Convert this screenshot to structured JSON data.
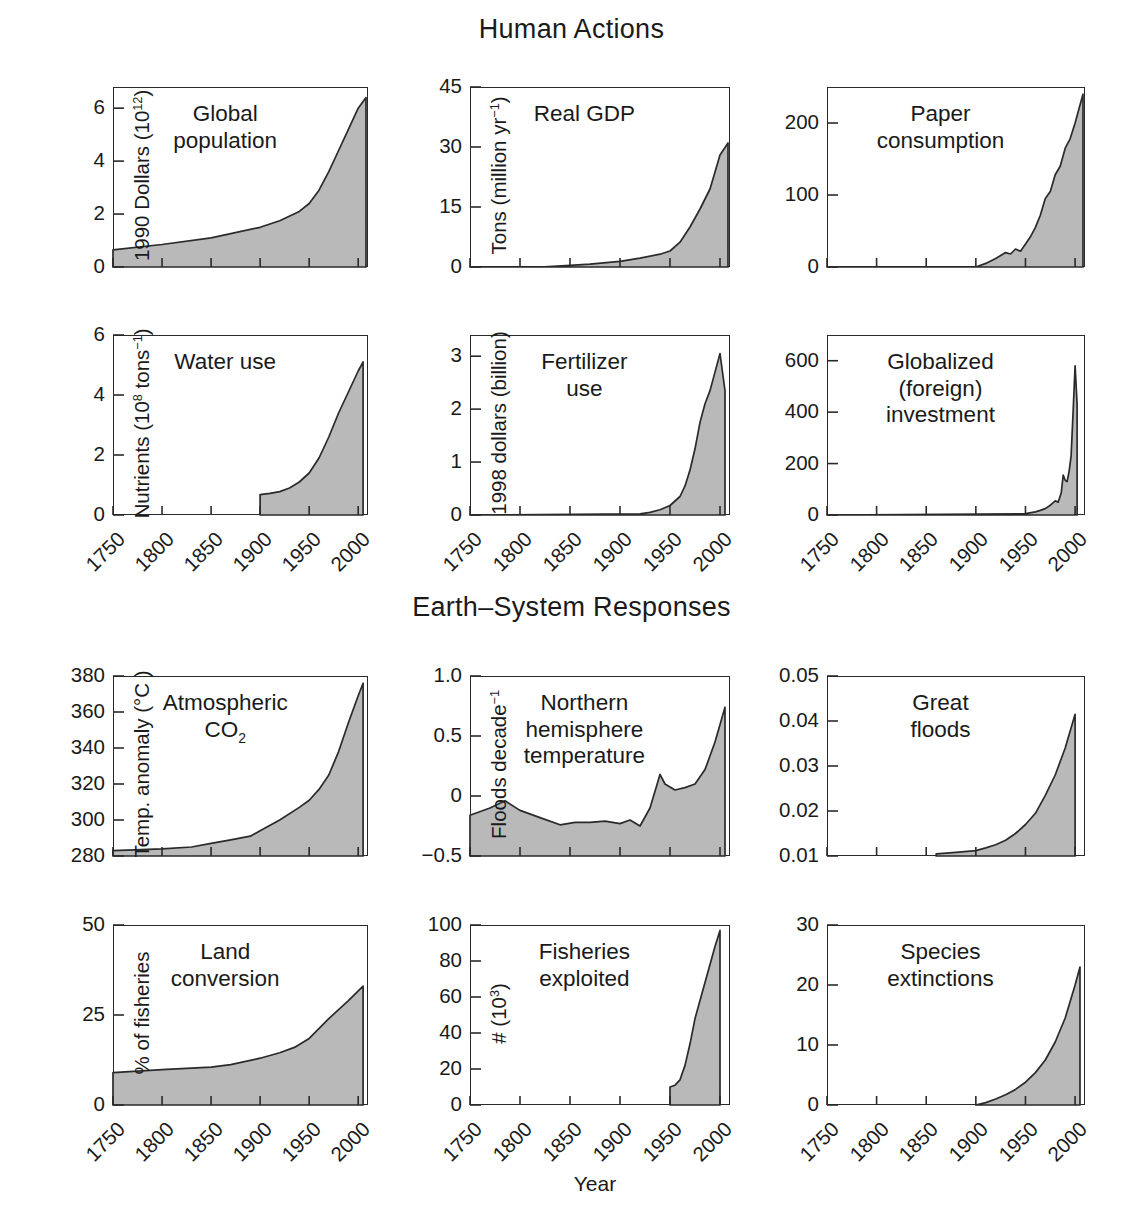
{
  "figure": {
    "section_titles": [
      "Human Actions",
      "Earth–System Responses"
    ],
    "x_axis_label": "Year",
    "x_ticks": [
      "1750",
      "1800",
      "1850",
      "1900",
      "1950",
      "2000"
    ],
    "x_range": [
      1750,
      2010
    ],
    "fill_color": "#b9b9b9",
    "line_color": "#2a2a2a",
    "axis_color": "#2a2a2a"
  },
  "chart_data": [
    {
      "id": "global-population",
      "type": "area",
      "title": "Global\npopulation",
      "ylabel": "People (billion)",
      "xlabel": "",
      "ylim": [
        0,
        6.8
      ],
      "yticks": [
        "0",
        "2",
        "4",
        "6"
      ],
      "ytickvals": [
        0,
        2,
        4,
        6
      ],
      "x": [
        1750,
        1800,
        1850,
        1900,
        1920,
        1940,
        1950,
        1960,
        1970,
        1980,
        1990,
        2000,
        2008
      ],
      "values": [
        0.65,
        0.85,
        1.1,
        1.5,
        1.75,
        2.1,
        2.4,
        2.9,
        3.6,
        4.4,
        5.2,
        6.0,
        6.4
      ],
      "grid": false
    },
    {
      "id": "real-gdp",
      "type": "area",
      "title": "Real GDP",
      "ylabel": "1990 Dollars (10¹²)",
      "xlabel": "",
      "ylim": [
        0,
        45
      ],
      "yticks": [
        "0",
        "15",
        "30",
        "45"
      ],
      "ytickvals": [
        0,
        15,
        30,
        45
      ],
      "x": [
        1750,
        1820,
        1850,
        1870,
        1900,
        1920,
        1940,
        1950,
        1960,
        1970,
        1980,
        1990,
        2000,
        2008
      ],
      "values": [
        0,
        0,
        0.4,
        0.7,
        1.4,
        2.2,
        3.2,
        4.0,
        6.2,
        10.0,
        14.5,
        19.5,
        28.0,
        31.0
      ],
      "grid": false
    },
    {
      "id": "paper-consumption",
      "type": "area",
      "title": "Paper\nconsumption",
      "ylabel": "Tons (million yr⁻¹)",
      "xlabel": "",
      "ylim": [
        0,
        250
      ],
      "yticks": [
        "0",
        "100",
        "200"
      ],
      "ytickvals": [
        0,
        100,
        200
      ],
      "x": [
        1750,
        1900,
        1910,
        1920,
        1930,
        1935,
        1940,
        1945,
        1950,
        1955,
        1960,
        1965,
        1970,
        1975,
        1980,
        1985,
        1990,
        1995,
        2000,
        2005,
        2008
      ],
      "values": [
        0,
        0,
        5,
        12,
        20,
        18,
        25,
        22,
        32,
        42,
        55,
        72,
        95,
        105,
        128,
        140,
        165,
        178,
        200,
        225,
        240
      ],
      "grid": false
    },
    {
      "id": "water-use",
      "type": "area",
      "title": "Water use",
      "ylabel": "(1000 km)³ yr⁻¹",
      "xlabel": "Year",
      "ylim": [
        0,
        6
      ],
      "yticks": [
        "0",
        "2",
        "4",
        "6"
      ],
      "ytickvals": [
        0,
        2,
        4,
        6
      ],
      "x": [
        1900,
        1910,
        1920,
        1930,
        1940,
        1950,
        1960,
        1970,
        1980,
        1990,
        2000,
        2005
      ],
      "values": [
        0.68,
        0.72,
        0.78,
        0.9,
        1.1,
        1.4,
        1.9,
        2.6,
        3.4,
        4.1,
        4.8,
        5.1
      ],
      "grid": false
    },
    {
      "id": "fertilizer-use",
      "type": "area",
      "title": "Fertilizer\nuse",
      "ylabel": "Nutrients (10⁸ tons⁻¹)",
      "xlabel": "Year",
      "ylim": [
        0,
        3.4
      ],
      "yticks": [
        "0",
        "1",
        "2",
        "3"
      ],
      "ytickvals": [
        0,
        1,
        2,
        3
      ],
      "x": [
        1750,
        1920,
        1930,
        1940,
        1950,
        1960,
        1965,
        1970,
        1975,
        1980,
        1985,
        1990,
        1995,
        2000,
        2005
      ],
      "values": [
        0,
        0.02,
        0.05,
        0.1,
        0.18,
        0.35,
        0.55,
        0.85,
        1.25,
        1.75,
        2.1,
        2.35,
        2.7,
        3.05,
        2.35
      ],
      "grid": false
    },
    {
      "id": "globalized-investment",
      "type": "area",
      "title": "Globalized\n(foreign)\ninvestment",
      "ylabel": "1998 dollars (billion)",
      "xlabel": "Year",
      "ylim": [
        0,
        700
      ],
      "yticks": [
        "0",
        "200",
        "400",
        "600"
      ],
      "ytickvals": [
        0,
        200,
        400,
        600
      ],
      "x": [
        1750,
        1950,
        1960,
        1965,
        1970,
        1975,
        1980,
        1983,
        1986,
        1988,
        1990,
        1992,
        1994,
        1996,
        1998,
        2000,
        2002
      ],
      "values": [
        0,
        5,
        12,
        18,
        25,
        38,
        55,
        50,
        85,
        155,
        135,
        130,
        170,
        230,
        400,
        580,
        430
      ],
      "grid": false
    },
    {
      "id": "atmospheric-co2",
      "type": "area",
      "title": "Atmospheric\nCO₂",
      "ylabel": "CO₂ (ppmv)",
      "xlabel": "",
      "ylim": [
        280,
        380
      ],
      "yticks": [
        "280",
        "300",
        "320",
        "340",
        "360",
        "380"
      ],
      "ytickvals": [
        280,
        300,
        320,
        340,
        360,
        380
      ],
      "x": [
        1750,
        1800,
        1830,
        1850,
        1870,
        1890,
        1900,
        1920,
        1940,
        1950,
        1960,
        1970,
        1980,
        1990,
        2000,
        2005
      ],
      "values": [
        283,
        284,
        285,
        287,
        289,
        291,
        294,
        300,
        307,
        311,
        317,
        325,
        338,
        354,
        369,
        376
      ],
      "grid": false
    },
    {
      "id": "nh-temperature",
      "type": "area",
      "title": "Northern\nhemisphere\ntemperature",
      "ylabel": "Temp. anomaly (°C )",
      "xlabel": "",
      "ylim": [
        -0.5,
        1.0
      ],
      "yticks": [
        "-0.5",
        "0",
        "0.5",
        "1.0"
      ],
      "ytickvals": [
        -0.5,
        0,
        0.5,
        1.0
      ],
      "x": [
        1750,
        1770,
        1785,
        1800,
        1820,
        1840,
        1855,
        1870,
        1885,
        1900,
        1910,
        1920,
        1930,
        1940,
        1945,
        1955,
        1965,
        1975,
        1985,
        1995,
        2005
      ],
      "values": [
        -0.16,
        -0.1,
        -0.04,
        -0.12,
        -0.18,
        -0.24,
        -0.22,
        -0.22,
        -0.21,
        -0.23,
        -0.2,
        -0.25,
        -0.1,
        0.18,
        0.1,
        0.05,
        0.07,
        0.1,
        0.22,
        0.45,
        0.74
      ],
      "grid": false
    },
    {
      "id": "great-floods",
      "type": "area",
      "title": "Great\nfloods",
      "ylabel": "Floods decade⁻¹",
      "xlabel": "",
      "ylim": [
        0.01,
        0.05
      ],
      "yticks": [
        "0.01",
        "0.02",
        "0.03",
        "0.04",
        "0.05"
      ],
      "ytickvals": [
        0.01,
        0.02,
        0.03,
        0.04,
        0.05
      ],
      "x": [
        1860,
        1880,
        1900,
        1910,
        1920,
        1930,
        1940,
        1950,
        1960,
        1970,
        1980,
        1990,
        2000
      ],
      "values": [
        0.0105,
        0.0108,
        0.0112,
        0.0118,
        0.0125,
        0.0135,
        0.015,
        0.017,
        0.0195,
        0.0235,
        0.028,
        0.034,
        0.0415
      ],
      "grid": false
    },
    {
      "id": "land-conversion",
      "type": "area",
      "title": "Land\nconversion",
      "ylabel": "% of land area",
      "xlabel": "Year",
      "ylim": [
        0,
        50
      ],
      "yticks": [
        "0",
        "25",
        "50"
      ],
      "ytickvals": [
        0,
        25,
        50
      ],
      "x": [
        1750,
        1800,
        1850,
        1870,
        1900,
        1920,
        1935,
        1950,
        1970,
        1990,
        2005
      ],
      "values": [
        9,
        9.8,
        10.5,
        11.2,
        13,
        14.5,
        16,
        18.5,
        24,
        29,
        33
      ],
      "grid": false
    },
    {
      "id": "fisheries-exploited",
      "type": "area",
      "title": "Fisheries\nexploited",
      "ylabel": "% of fisheries",
      "xlabel": "Year",
      "ylim": [
        0,
        100
      ],
      "yticks": [
        "0",
        "20",
        "40",
        "60",
        "80",
        "100"
      ],
      "ytickvals": [
        0,
        20,
        40,
        60,
        80,
        100
      ],
      "x": [
        1950,
        1955,
        1960,
        1965,
        1970,
        1975,
        1980,
        1985,
        1990,
        1995,
        2000
      ],
      "values": [
        10,
        11,
        14,
        22,
        34,
        48,
        58,
        68,
        78,
        88,
        97
      ],
      "grid": false
    },
    {
      "id": "species-extinctions",
      "type": "area",
      "title": "Species\nextinctions",
      "ylabel": "# (10³)",
      "xlabel": "Year",
      "ylim": [
        0,
        30
      ],
      "yticks": [
        "0",
        "10",
        "20",
        "30"
      ],
      "ytickvals": [
        0,
        10,
        20,
        30
      ],
      "x": [
        1900,
        1910,
        1920,
        1930,
        1940,
        1950,
        1960,
        1970,
        1980,
        1990,
        2000,
        2005
      ],
      "values": [
        0,
        0.4,
        1.0,
        1.7,
        2.6,
        3.8,
        5.4,
        7.5,
        10.5,
        14.5,
        20.0,
        23.0
      ],
      "grid": false
    }
  ]
}
